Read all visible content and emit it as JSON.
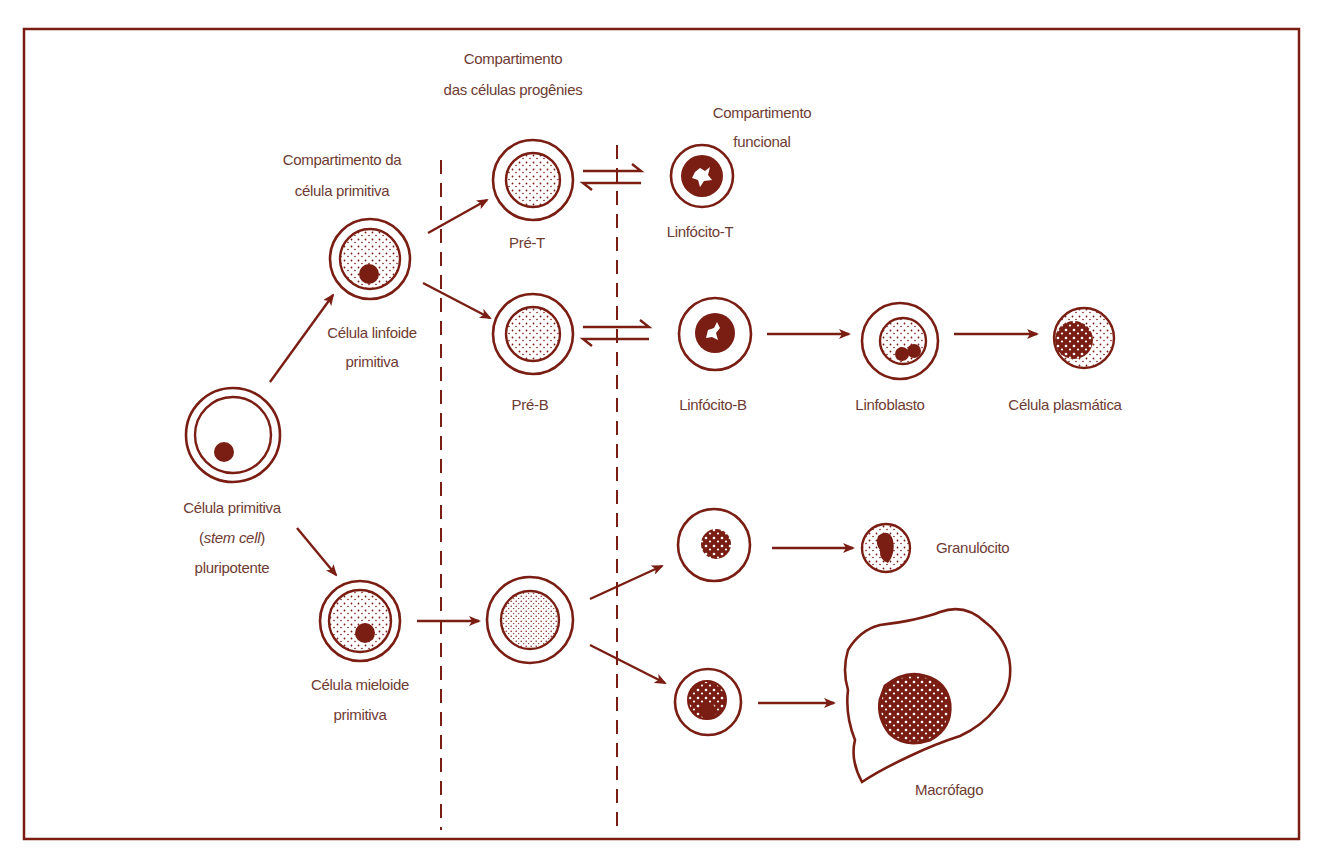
{
  "diagram": {
    "colors": {
      "stroke": "#7a1e14",
      "text": "#6e3b33",
      "background": "#ffffff"
    },
    "compartments": {
      "primitive": {
        "line1": "Compartimento da",
        "line2": "célula primitiva"
      },
      "progeny": {
        "line1": "Compartimento",
        "line2": "das células progênies"
      },
      "functional": {
        "line1": "Compartimento",
        "line2": "funcional"
      }
    },
    "cells": {
      "stem": {
        "line1": "Célula primitiva",
        "line2_open": "(",
        "line2_italic": "stem cell",
        "line2_close": ")",
        "line3": "pluripotente"
      },
      "lymphoid": {
        "line1": "Célula linfoide",
        "line2": "primitiva"
      },
      "myeloid": {
        "line1": "Célula mieloide",
        "line2": "primitiva"
      },
      "pre_t": {
        "label": "Pré-T"
      },
      "pre_b": {
        "label": "Pré-B"
      },
      "myeloid_progeny": {
        "label": ""
      },
      "t_lymphocyte": {
        "label": "Linfócito-T"
      },
      "b_lymphocyte": {
        "label": "Linfócito-B"
      },
      "lymphoblast": {
        "label": "Linfoblasto"
      },
      "plasma_cell": {
        "label": "Célula plasmática"
      },
      "granulocyte_precursor": {
        "label": ""
      },
      "granulocyte": {
        "label": "Granulócito"
      },
      "monocyte": {
        "label": ""
      },
      "macrophage": {
        "label": "Macrófago"
      }
    },
    "flows": [
      {
        "from": "stem",
        "to": "lymphoid",
        "type": "arrow"
      },
      {
        "from": "stem",
        "to": "myeloid",
        "type": "arrow"
      },
      {
        "from": "lymphoid",
        "to": "pre_t",
        "type": "arrow"
      },
      {
        "from": "lymphoid",
        "to": "pre_b",
        "type": "arrow"
      },
      {
        "from": "pre_t",
        "to": "t_lymphocyte",
        "type": "reversible"
      },
      {
        "from": "pre_b",
        "to": "b_lymphocyte",
        "type": "reversible"
      },
      {
        "from": "b_lymphocyte",
        "to": "lymphoblast",
        "type": "arrow"
      },
      {
        "from": "lymphoblast",
        "to": "plasma_cell",
        "type": "arrow"
      },
      {
        "from": "myeloid",
        "to": "myeloid_progeny",
        "type": "arrow"
      },
      {
        "from": "myeloid_progeny",
        "to": "granulocyte_precursor",
        "type": "arrow"
      },
      {
        "from": "myeloid_progeny",
        "to": "monocyte",
        "type": "arrow"
      },
      {
        "from": "granulocyte_precursor",
        "to": "granulocyte",
        "type": "arrow"
      },
      {
        "from": "monocyte",
        "to": "macrophage",
        "type": "arrow"
      }
    ]
  }
}
